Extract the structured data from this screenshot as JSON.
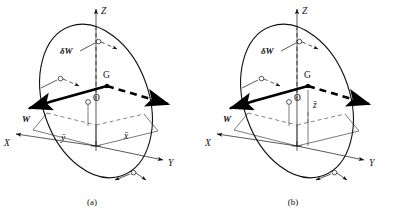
{
  "figure": {
    "type": "engineering-mechanics-diagram",
    "background_color": "#ffffff",
    "ink_color": "#111111"
  },
  "panels": [
    {
      "id": "a",
      "caption": "(a)",
      "axes": [
        {
          "name": "z-axis",
          "label": "Z",
          "direction": "up"
        },
        {
          "name": "x-axis",
          "label": "X",
          "direction": "lower-left"
        },
        {
          "name": "y-axis",
          "label": "Y",
          "direction": "lower-right"
        }
      ],
      "points": [
        {
          "name": "origin",
          "label": "O"
        },
        {
          "name": "centre-of-gravity",
          "label": "G"
        }
      ],
      "vectors": [
        {
          "name": "weight-vector",
          "label": "W",
          "style": "bold-solid-arrow"
        },
        {
          "name": "virtual-work-vector",
          "label": "δW",
          "style": "bold-label"
        },
        {
          "name": "resultant-dashed-vector",
          "label": "",
          "style": "bold-dashed-arrow"
        }
      ],
      "dimensions": [
        {
          "name": "y-bar-dimension",
          "label": "ȳ"
        },
        {
          "name": "x-bar-dimension",
          "label": "x̄"
        }
      ],
      "rotation_markers": 3
    },
    {
      "id": "b",
      "caption": "(b)",
      "axes": [
        {
          "name": "z-axis",
          "label": "Z",
          "direction": "up"
        },
        {
          "name": "x-axis",
          "label": "X",
          "direction": "lower-left"
        },
        {
          "name": "y-axis",
          "label": "Y",
          "direction": "lower-right"
        }
      ],
      "points": [
        {
          "name": "origin",
          "label": "O"
        },
        {
          "name": "centre-of-gravity",
          "label": "G"
        }
      ],
      "vectors": [
        {
          "name": "weight-vector",
          "label": "W",
          "style": "bold-solid-arrow"
        },
        {
          "name": "virtual-work-vector",
          "label": "δW",
          "style": "bold-label"
        },
        {
          "name": "resultant-dashed-vector",
          "label": "",
          "style": "bold-dashed-arrow"
        }
      ],
      "dimensions": [
        {
          "name": "z-bar-dimension",
          "label": "z̄"
        }
      ],
      "rotation_markers": 3
    }
  ]
}
